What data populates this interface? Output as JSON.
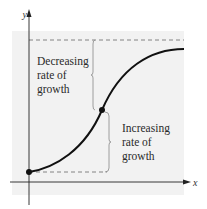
{
  "diagram": {
    "axes": {
      "x_label": "x",
      "y_label": "y"
    },
    "upper_annotation": {
      "lines": [
        "Decreasing",
        "rate of",
        "growth"
      ]
    },
    "lower_annotation": {
      "lines": [
        "Increasing",
        "rate of",
        "growth"
      ]
    },
    "curve": {
      "type": "logistic (S-shaped) growth curve",
      "points": [
        "start point on y-axis",
        "inflection point"
      ]
    },
    "colors": {
      "panel": "#f2f2f2",
      "curve": "#111111",
      "dashed": "#777777"
    }
  }
}
